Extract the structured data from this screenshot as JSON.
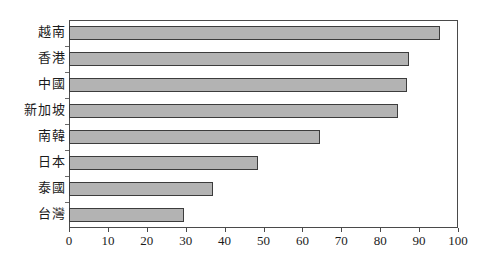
{
  "chart_data": {
    "type": "bar",
    "orientation": "horizontal",
    "title": "",
    "subtitle": "",
    "xlabel": "",
    "ylabel": "",
    "xlim": [
      0,
      100
    ],
    "xticks": [
      0,
      10,
      20,
      30,
      40,
      50,
      60,
      70,
      80,
      90,
      100
    ],
    "xtick_labels": [
      "0",
      "10",
      "20",
      "30",
      "40",
      "50",
      "60",
      "70",
      "80",
      "90",
      "100"
    ],
    "grid": false,
    "legend": null,
    "categories": [
      "越南",
      "香港",
      "中國",
      "新加坡",
      "南韓",
      "日本",
      "泰國",
      "台灣"
    ],
    "values": [
      95.5,
      87.5,
      87,
      84.5,
      64.5,
      48.5,
      37,
      29.5
    ],
    "series": [
      {
        "name": "",
        "values": [
          95.5,
          87.5,
          87,
          84.5,
          64.5,
          48.5,
          37,
          29.5
        ]
      }
    ],
    "bar_fill_color": "#b3b3b3",
    "bar_border_color": "#3c3c3c",
    "frame_color": "#4a4a4a",
    "background_color": "#ffffff",
    "annotations": []
  }
}
